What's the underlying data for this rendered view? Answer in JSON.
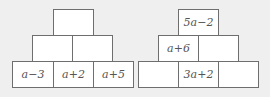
{
  "left_pyramid": {
    "top": [
      ""
    ],
    "middle": [
      "",
      ""
    ],
    "bottom": [
      "a−3",
      "a+2",
      "a+5"
    ]
  },
  "right_pyramid": {
    "top": [
      "5a−2"
    ],
    "middle": [
      "a+6",
      ""
    ],
    "bottom": [
      "",
      "3a+2",
      ""
    ]
  },
  "colors": {
    "background": "#efefef",
    "cell_fill": "#ffffff",
    "cell_border": "#6e6e6e",
    "text": "#555555"
  }
}
